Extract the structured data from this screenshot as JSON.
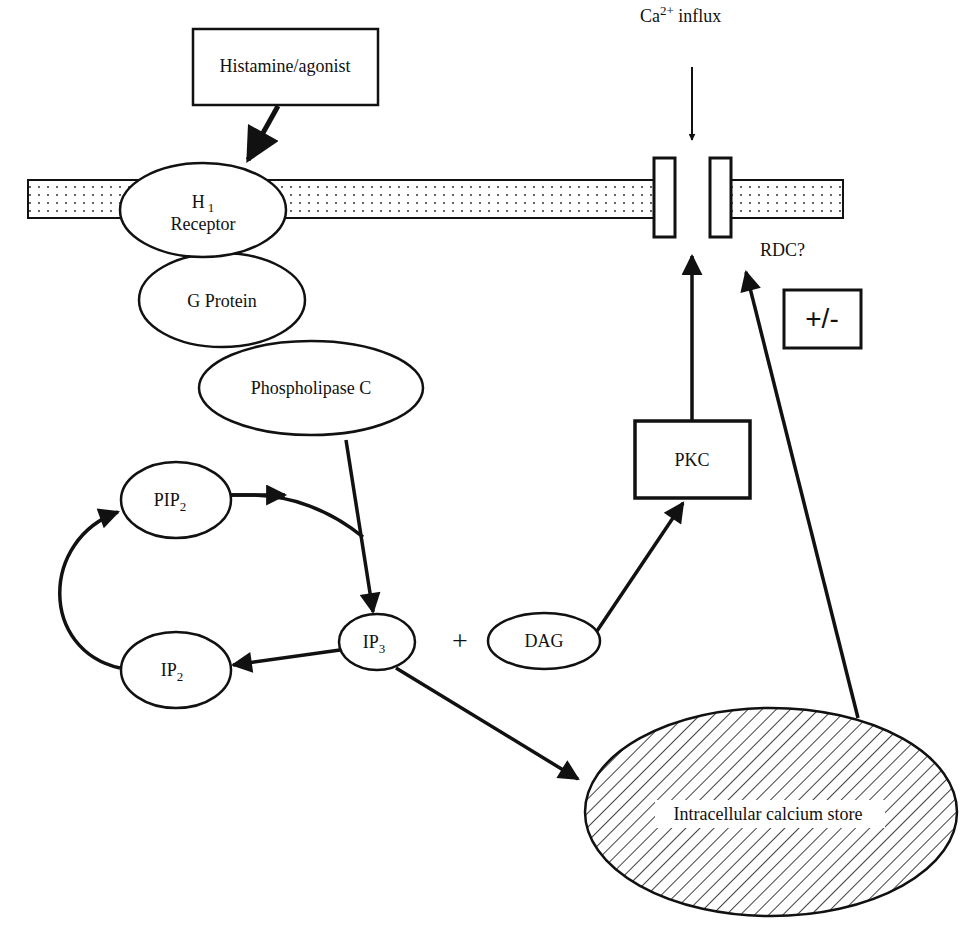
{
  "diagram": {
    "nodes": {
      "agonist": {
        "label": "Histamine/agonist",
        "shape": "box"
      },
      "receptor": {
        "label_main": "H",
        "label_sub": "1",
        "label_line2": "Receptor",
        "shape": "ellipse"
      },
      "gprotein": {
        "label": "G Protein",
        "shape": "ellipse"
      },
      "plc": {
        "label": "Phospholipase C",
        "shape": "ellipse"
      },
      "pip2": {
        "label_main": "PIP",
        "label_sub": "2",
        "shape": "ellipse"
      },
      "ip2": {
        "label_main": "IP",
        "label_sub": "2",
        "shape": "ellipse"
      },
      "ip3": {
        "label_main": "IP",
        "label_sub": "3",
        "shape": "ellipse"
      },
      "plus": {
        "label": "+"
      },
      "dag": {
        "label": "DAG",
        "shape": "ellipse"
      },
      "pkc": {
        "label": "PKC",
        "shape": "box"
      },
      "store": {
        "label": "Intracellular calcium store",
        "shape": "hatched-ellipse"
      },
      "influx": {
        "label_main": "Ca",
        "label_sup": "2+",
        "label_rest": " influx"
      },
      "channel": {
        "label": "RDC?"
      },
      "modulation": {
        "label": "+/-",
        "shape": "box"
      }
    },
    "edges": [
      {
        "from": "Histamine/agonist",
        "to": "H1 Receptor"
      },
      {
        "from": "Phospholipase C",
        "to": "IP3"
      },
      {
        "from": "PIP2",
        "to": "IP3"
      },
      {
        "from": "IP3",
        "to": "IP2"
      },
      {
        "from": "IP2",
        "to": "PIP2"
      },
      {
        "from": "IP3",
        "to": "Intracellular calcium store"
      },
      {
        "from": "DAG",
        "to": "PKC"
      },
      {
        "from": "PKC",
        "to": "RDC?"
      },
      {
        "from": "Intracellular calcium store",
        "to": "RDC?"
      },
      {
        "from": "Ca2+ influx",
        "to": "RDC?"
      }
    ],
    "colors": {
      "ink": "#111111",
      "background": "#ffffff",
      "membrane_dots": "#333333"
    }
  }
}
